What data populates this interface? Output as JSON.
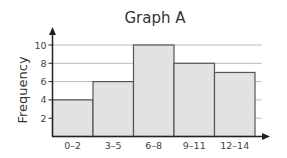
{
  "chart_data": {
    "type": "bar",
    "subtype": "histogram",
    "title": "Graph A",
    "xlabel": "",
    "ylabel": "Frequency",
    "categories": [
      "0–2",
      "3–5",
      "6–8",
      "9–11",
      "12–14"
    ],
    "values": [
      4,
      6,
      10,
      8,
      7
    ],
    "yticks": [
      2,
      4,
      6,
      8,
      10
    ],
    "ylim": [
      0,
      11
    ],
    "grid": true,
    "legend": null,
    "colors": {
      "bar_fill": "#e2e2e2",
      "bar_stroke": "#555555",
      "grid": "#bbbbbb",
      "axis": "#222222"
    }
  }
}
